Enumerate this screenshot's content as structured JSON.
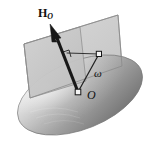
{
  "figure": {
    "background_color": "#ffffff",
    "labels": {
      "angular_momentum_symbol": "H",
      "angular_momentum_subscript": "O",
      "angular_velocity": "ω",
      "origin_point": "O"
    },
    "colors": {
      "vector_arrow": "#1a1a1a",
      "plane_fill": "#c9c9c9",
      "plane_stroke": "#8a8a8a",
      "ellipsoid_light": "#e8e8e8",
      "ellipsoid_mid": "#a8a8a8",
      "ellipsoid_dark": "#6e6e6e",
      "ellipsoid_stroke": "#7a7a7a",
      "thin_line": "#2b2b2b",
      "label_text": "#111111",
      "marker_fill": "#f2f2f2",
      "marker_stroke": "#1a1a1a"
    },
    "elements": {
      "ellipsoid_name": "inertia-ellipsoid",
      "plane_name": "invariable-plane",
      "vector_name": "angular-momentum-vector",
      "omega_line_name": "angular-velocity-line",
      "right_angle_name": "right-angle-marker",
      "origin_marker_name": "origin-point-marker",
      "omega_marker_name": "omega-point-marker"
    },
    "geometry": {
      "origin_xy": [
        78,
        92
      ],
      "arrow_tip_xy": [
        51,
        26
      ],
      "omega_point_xy": [
        99,
        54
      ],
      "ellipsoid_center_xy": [
        80,
        95
      ],
      "ellipsoid_rx": 66,
      "ellipsoid_ry": 34,
      "ellipsoid_rotation_deg": -22
    }
  }
}
